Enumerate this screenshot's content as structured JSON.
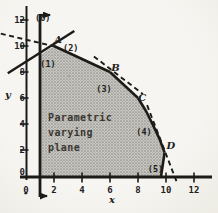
{
  "figure_caption": "Parametric varying plane",
  "chart_data": {
    "type": "area",
    "title": "",
    "xlabel": "x",
    "ylabel": "y",
    "xlim": [
      0,
      12
    ],
    "ylim": [
      0,
      12
    ],
    "grid": false,
    "x_ticks": [
      "0",
      "2",
      "4",
      "6",
      "8",
      "10",
      "12"
    ],
    "y_ticks": [
      "0",
      "2",
      "4",
      "6",
      "8",
      "10",
      "12"
    ],
    "px_layout": {
      "x0": 26,
      "x_scale": 14,
      "y0": 176,
      "y_scale": 13,
      "ink": "#1c1b18"
    },
    "region_text": {
      "lines": [
        "Parametric",
        "varying",
        "plane"
      ],
      "x": 1.57,
      "y": 4.23,
      "line_step": 1.154
    },
    "vertices": [
      {
        "label": "A",
        "x": 2,
        "y": 10,
        "label_pos": [
          2.3,
          10.45
        ]
      },
      {
        "label": "B",
        "x": 6,
        "y": 8,
        "label_pos": [
          6.4,
          8.3
        ]
      },
      {
        "label": "C",
        "x": 8,
        "y": 6,
        "label_pos": [
          8.3,
          6.0
        ]
      },
      {
        "label": "D",
        "x": 9.9,
        "y": 1.8,
        "label_pos": [
          10.35,
          2.3
        ]
      }
    ],
    "feasible_region": [
      [
        1,
        0
      ],
      [
        1,
        9.3
      ],
      [
        2,
        10
      ],
      [
        6,
        8
      ],
      [
        8,
        6
      ],
      [
        8.57,
        5.0
      ],
      [
        9.06,
        3.95
      ],
      [
        9.52,
        2.89
      ],
      [
        9.9,
        1.8
      ],
      [
        9.65,
        0
      ]
    ],
    "solid_edges": [
      {
        "name": "constraint-1-line",
        "width": 2.4,
        "points": [
          [
            -1.3,
            7.9
          ],
          [
            3.45,
            11.15
          ]
        ]
      },
      {
        "name": "constraint-2-edge",
        "width": 2.6,
        "points": [
          [
            2,
            10
          ],
          [
            6,
            8
          ]
        ]
      },
      {
        "name": "constraint-3-edge",
        "width": 2.6,
        "points": [
          [
            6,
            8
          ],
          [
            8,
            6
          ]
        ]
      },
      {
        "name": "constraint-4-edge",
        "width": 2.6,
        "points": [
          [
            8,
            6
          ],
          [
            8.57,
            5.0
          ],
          [
            9.06,
            3.95
          ],
          [
            9.52,
            2.89
          ],
          [
            9.9,
            1.8
          ]
        ]
      },
      {
        "name": "constraint-5-edge",
        "width": 2.6,
        "points": [
          [
            9.9,
            1.8
          ],
          [
            9.65,
            0
          ]
        ]
      }
    ],
    "dashed_lines": [
      {
        "name": "objective-line-through-A",
        "points": [
          [
            -1.8,
            10.95
          ],
          [
            2.3,
            9.9
          ]
        ]
      },
      {
        "name": "objective-line-through-B",
        "points": [
          [
            4.85,
            9.2
          ],
          [
            8.35,
            6.3
          ]
        ]
      },
      {
        "name": "objective-line-through-D",
        "points": [
          [
            8.65,
            5.45
          ],
          [
            10.8,
            -0.55
          ]
        ]
      }
    ],
    "constraint6_line": {
      "x": 1,
      "arrow_dir": "right"
    },
    "constraint_labels": [
      {
        "text": "(1)",
        "x": 1.57,
        "y": 8.6
      },
      {
        "text": "(2)",
        "x": 3.2,
        "y": 9.85
      },
      {
        "text": "(3)",
        "x": 5.57,
        "y": 6.7
      },
      {
        "text": "(4)",
        "x": 8.43,
        "y": 3.38
      },
      {
        "text": "(5)",
        "x": 9.25,
        "y": 0.55
      },
      {
        "text": "(6)",
        "x": 1.2,
        "y": 12.15
      }
    ],
    "axis_label_pos": {
      "x": [
        6.15,
        -2.05
      ],
      "y": [
        -1.29,
        6.0
      ]
    },
    "axis_artifact_dash": "-"
  }
}
